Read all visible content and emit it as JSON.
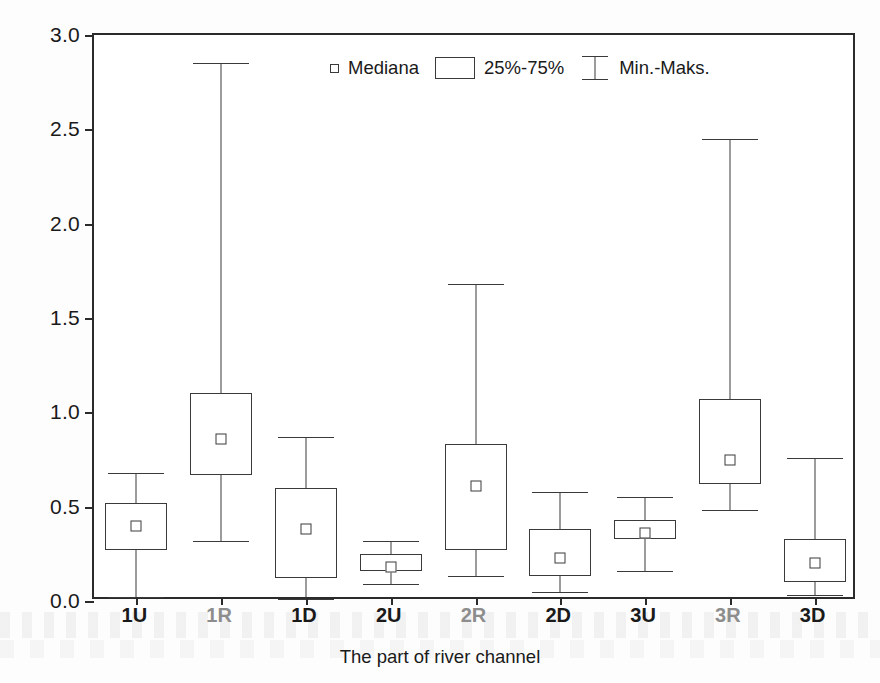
{
  "chart_data": {
    "type": "box",
    "title": "",
    "xlabel": "The part of river channel",
    "ylabel": "The average values of velocities - V [m s",
    "ylabel_sup": "-1",
    "ylabel_tail": "]",
    "ylim": [
      0.0,
      3.0
    ],
    "ytick_labels": [
      "0.0",
      "0.5",
      "1.0",
      "1.5",
      "2.0",
      "2.5",
      "3.0"
    ],
    "ytick_values": [
      0.0,
      0.5,
      1.0,
      1.5,
      2.0,
      2.5,
      3.0
    ],
    "grid": false,
    "legend_position": "top-center",
    "legend": [
      {
        "key": "median",
        "label": "Mediana",
        "marker": "small-square"
      },
      {
        "key": "iqr",
        "label": "25%-75%",
        "marker": "box-outline"
      },
      {
        "key": "range",
        "label": "Min.-Maks.",
        "marker": "i-beam"
      }
    ],
    "categories": [
      "1U",
      "1R",
      "1D",
      "2U",
      "2R",
      "2D",
      "3U",
      "3R",
      "3D"
    ],
    "category_style": [
      "dark",
      "faded",
      "dark",
      "dark",
      "faded",
      "dark",
      "dark",
      "faded",
      "dark"
    ],
    "boxes": [
      {
        "category": "1U",
        "min": 0.02,
        "q1": 0.27,
        "median": 0.4,
        "q3": 0.52,
        "max": 0.68
      },
      {
        "category": "1R",
        "min": 0.32,
        "q1": 0.67,
        "median": 0.86,
        "q3": 1.1,
        "max": 2.85
      },
      {
        "category": "1D",
        "min": 0.01,
        "q1": 0.12,
        "median": 0.38,
        "q3": 0.6,
        "max": 0.87
      },
      {
        "category": "2U",
        "min": 0.09,
        "q1": 0.16,
        "median": 0.18,
        "q3": 0.25,
        "max": 0.32
      },
      {
        "category": "2R",
        "min": 0.13,
        "q1": 0.27,
        "median": 0.61,
        "q3": 0.83,
        "max": 1.68
      },
      {
        "category": "2D",
        "min": 0.05,
        "q1": 0.13,
        "median": 0.23,
        "q3": 0.38,
        "max": 0.58
      },
      {
        "category": "3U",
        "min": 0.16,
        "q1": 0.33,
        "median": 0.36,
        "q3": 0.43,
        "max": 0.55
      },
      {
        "category": "3R",
        "min": 0.48,
        "q1": 0.62,
        "median": 0.75,
        "q3": 1.07,
        "max": 2.45
      },
      {
        "category": "3D",
        "min": 0.03,
        "q1": 0.1,
        "median": 0.2,
        "q3": 0.33,
        "max": 0.76
      }
    ],
    "colors": {
      "line": "#3a3a3a",
      "frame": "#2b2b2b",
      "text": "#1a1a1a",
      "faded_text": "#8d8d8d",
      "background": "#ffffff"
    }
  }
}
